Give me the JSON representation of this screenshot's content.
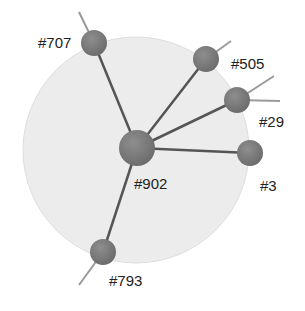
{
  "diagram": {
    "type": "network-star",
    "background_circle": {
      "cx": 136,
      "cy": 150,
      "r": 113,
      "fill": "#ececec"
    },
    "colors": {
      "node": "#7a7a7a",
      "edge": "#555555",
      "external_edge": "#9a9a9a",
      "label": "#222222"
    },
    "center": {
      "id": "#902",
      "x": 137,
      "y": 148,
      "r": 18,
      "label_x": 134,
      "label_y": 189
    },
    "nodes": [
      {
        "id": "#707",
        "x": 94,
        "y": 43,
        "r": 13,
        "label_x": 38,
        "label_y": 48
      },
      {
        "id": "#505",
        "x": 206,
        "y": 59,
        "r": 13,
        "label_x": 231,
        "label_y": 69
      },
      {
        "id": "#29",
        "x": 237,
        "y": 100,
        "r": 13,
        "label_x": 259,
        "label_y": 127
      },
      {
        "id": "#3",
        "x": 250,
        "y": 153,
        "r": 13,
        "label_x": 260,
        "label_y": 191
      },
      {
        "id": "#793",
        "x": 103,
        "y": 252,
        "r": 13,
        "label_x": 109,
        "label_y": 286
      }
    ],
    "external_edges": [
      {
        "x1": 94,
        "y1": 43,
        "x2": 79,
        "y2": 12
      },
      {
        "x1": 206,
        "y1": 59,
        "x2": 231,
        "y2": 41
      },
      {
        "x1": 237,
        "y1": 100,
        "x2": 274,
        "y2": 76
      },
      {
        "x1": 237,
        "y1": 100,
        "x2": 280,
        "y2": 101
      },
      {
        "x1": 103,
        "y1": 252,
        "x2": 79,
        "y2": 285
      }
    ]
  }
}
